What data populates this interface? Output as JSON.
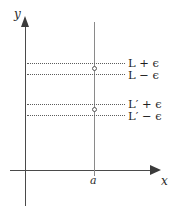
{
  "figure": {
    "axes": {
      "x_label": "x",
      "y_label": "y",
      "tick_label_a": "a"
    },
    "bounds": [
      {
        "id": "L-plus",
        "text": "L + ϵ"
      },
      {
        "id": "L-minus",
        "text": "L − ϵ"
      },
      {
        "id": "Lp-plus",
        "text": "L′ + ϵ"
      },
      {
        "id": "Lp-minus",
        "text": "L′ − ϵ"
      }
    ],
    "colors": {
      "axis": "#4a4a4a",
      "vertical_line": "#8a8a8a",
      "dotted_line": "#5d5d5d",
      "circle_stroke": "#555555",
      "background": "#ffffff"
    }
  },
  "chart_data": {
    "type": "line",
    "title": "",
    "xlabel": "x",
    "ylabel": "y",
    "grid": false,
    "legend": "none",
    "annotations": [
      "L + ϵ",
      "L − ϵ",
      "L′ + ϵ",
      "L′ − ϵ",
      "a"
    ],
    "vertical_lines": [
      {
        "label": "a",
        "style": "solid"
      }
    ],
    "horizontal_dotted_lines": [
      {
        "label": "L + ϵ"
      },
      {
        "label": "L − ϵ"
      },
      {
        "label": "L′ + ϵ"
      },
      {
        "label": "L′ − ϵ"
      }
    ],
    "open_points": [
      {
        "x": "a",
        "y": "L"
      },
      {
        "x": "a",
        "y": "L′"
      }
    ]
  }
}
